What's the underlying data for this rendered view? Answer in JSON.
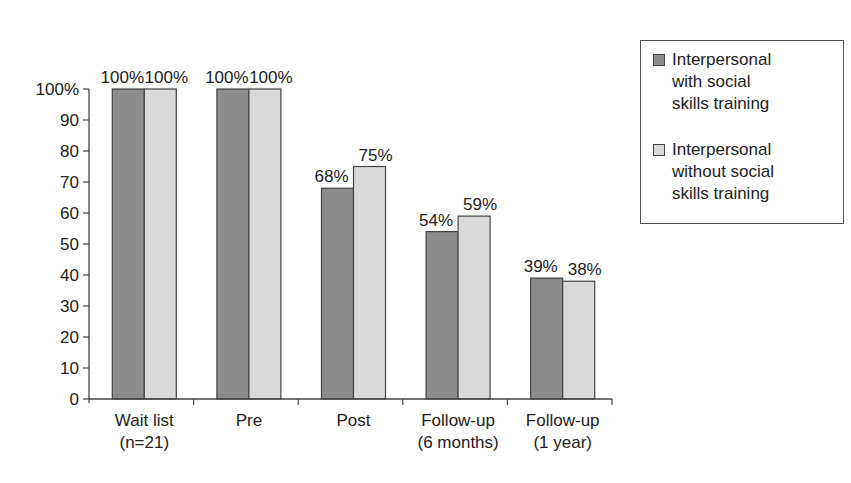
{
  "chart_data": {
    "type": "bar",
    "title": "",
    "xlabel": "",
    "ylabel": "",
    "ylim": [
      0,
      100
    ],
    "yticks": [
      "0",
      "10",
      "20",
      "30",
      "40",
      "50",
      "60",
      "70",
      "80",
      "90",
      "100%"
    ],
    "grid": false,
    "legend_position": "right",
    "categories": [
      "Wait list\n(n=21)",
      "Pre",
      "Post",
      "Follow-up\n(6 months)",
      "Follow-up\n(1 year)"
    ],
    "series": [
      {
        "name": "Interpersonal with social skills training",
        "color": "#8c8c8c",
        "values": [
          100,
          100,
          68,
          54,
          39
        ],
        "labels": [
          "100%",
          "100%",
          "68%",
          "54%",
          "39%"
        ]
      },
      {
        "name": "Interpersonal without social skills training",
        "color": "#d9d9d9",
        "values": [
          100,
          100,
          75,
          59,
          38
        ],
        "labels": [
          "100%",
          "100%",
          "75%",
          "59%",
          "38%"
        ]
      }
    ]
  },
  "legend": {
    "items": [
      {
        "label": "Interpersonal with social skills training",
        "lines": [
          "Interpersonal",
          "with social",
          "skills training"
        ],
        "color": "#8c8c8c"
      },
      {
        "label": "Interpersonal without social skills training",
        "lines": [
          "Interpersonal",
          "without social",
          "skills training"
        ],
        "color": "#d9d9d9"
      }
    ]
  }
}
